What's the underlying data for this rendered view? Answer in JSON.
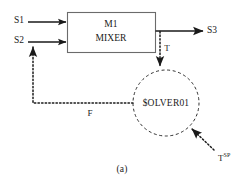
{
  "figure": {
    "caption": "(a)",
    "unit_block": {
      "line1": "M1",
      "line2": "MIXER"
    },
    "controller": {
      "label": "$OLVER01"
    },
    "streams": {
      "inlet_1": "S1",
      "inlet_2": "S2",
      "outlet": "S3"
    },
    "signals": {
      "temperature": "T",
      "flow": "F",
      "setpoint_base": "T",
      "setpoint_sup": "SP"
    },
    "colors": {
      "line": "#1a1a1a",
      "box_stroke": "#6b6b6b",
      "background": "#ffffff"
    }
  }
}
